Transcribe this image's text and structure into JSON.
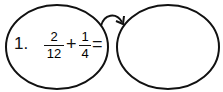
{
  "problem": {
    "number": "1.",
    "fraction_a": {
      "numerator": "2",
      "denominator": "12"
    },
    "operator": "+",
    "fraction_b": {
      "numerator": "1",
      "denominator": "4"
    },
    "equals": "="
  },
  "answer_bubble": {
    "value": ""
  },
  "colors": {
    "stroke": "#111111",
    "background": "#ffffff"
  }
}
